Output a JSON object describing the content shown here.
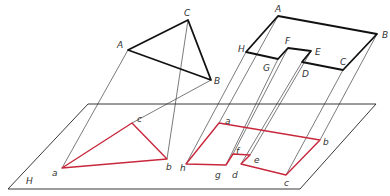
{
  "colors": {
    "object": "#111111",
    "projection": "#c8283c",
    "projector": "#222222",
    "plane": "#222222"
  },
  "plane": {
    "label": "H",
    "points": [
      [
        8,
        189
      ],
      [
        88,
        104
      ],
      [
        376,
        104
      ],
      [
        300,
        189
      ]
    ],
    "label_pos": [
      26,
      184
    ]
  },
  "triangle": {
    "object": {
      "vertices": [
        {
          "name": "A",
          "pos": [
            128,
            50
          ],
          "label_pos": [
            117,
            48
          ]
        },
        {
          "name": "C",
          "pos": [
            188,
            20
          ],
          "label_pos": [
            184,
            16
          ]
        },
        {
          "name": "B",
          "pos": [
            211,
            80
          ],
          "label_pos": [
            214,
            84
          ]
        }
      ]
    },
    "projection": {
      "vertices": [
        {
          "name": "a",
          "pos": [
            62,
            168
          ],
          "label_pos": [
            52,
            176
          ]
        },
        {
          "name": "b",
          "pos": [
            167,
            159
          ],
          "label_pos": [
            166,
            170
          ]
        },
        {
          "name": "c",
          "pos": [
            132,
            123
          ],
          "label_pos": [
            137,
            122
          ]
        }
      ]
    }
  },
  "l_shape": {
    "object": {
      "vertices": [
        {
          "name": "A",
          "pos": [
            278,
            16
          ],
          "label_pos": [
            275,
            12
          ]
        },
        {
          "name": "B",
          "pos": [
            377,
            34
          ],
          "label_pos": [
            382,
            38
          ]
        },
        {
          "name": "C",
          "pos": [
            343,
            70
          ],
          "label_pos": [
            340,
            65
          ]
        },
        {
          "name": "D",
          "pos": [
            302,
            62
          ],
          "label_pos": [
            302,
            77
          ]
        },
        {
          "name": "E",
          "pos": [
            311,
            51
          ],
          "label_pos": [
            315,
            55
          ]
        },
        {
          "name": "F",
          "pos": [
            288,
            48
          ],
          "label_pos": [
            285,
            44
          ]
        },
        {
          "name": "G",
          "pos": [
            278,
            59
          ],
          "label_pos": [
            263,
            71
          ]
        },
        {
          "name": "H",
          "pos": [
            246,
            52
          ],
          "label_pos": [
            238,
            52
          ]
        }
      ]
    },
    "projection": {
      "vertices": [
        {
          "name": "a",
          "pos": [
            219,
            123
          ],
          "label_pos": [
            225,
            124
          ]
        },
        {
          "name": "b",
          "pos": [
            320,
            140
          ],
          "label_pos": [
            323,
            145
          ]
        },
        {
          "name": "c",
          "pos": [
            286,
            175
          ],
          "label_pos": [
            284,
            186
          ]
        },
        {
          "name": "d",
          "pos": [
            241,
            164
          ],
          "label_pos": [
            232,
            178
          ]
        },
        {
          "name": "e",
          "pos": [
            250,
            155
          ],
          "label_pos": [
            254,
            163
          ]
        },
        {
          "name": "f",
          "pos": [
            233,
            154
          ],
          "label_pos": [
            236,
            154
          ]
        },
        {
          "name": "g",
          "pos": [
            226,
            165
          ],
          "label_pos": [
            215,
            178
          ]
        },
        {
          "name": "h",
          "pos": [
            186,
            164
          ],
          "label_pos": [
            180,
            171
          ]
        }
      ]
    }
  }
}
